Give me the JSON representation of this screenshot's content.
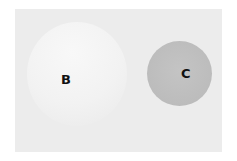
{
  "diagram": {
    "circles": [
      {
        "label": "B",
        "color": "#f2f2f2"
      },
      {
        "label": "C",
        "color": "#bcbcbc"
      }
    ],
    "background_color": "#ececec"
  }
}
